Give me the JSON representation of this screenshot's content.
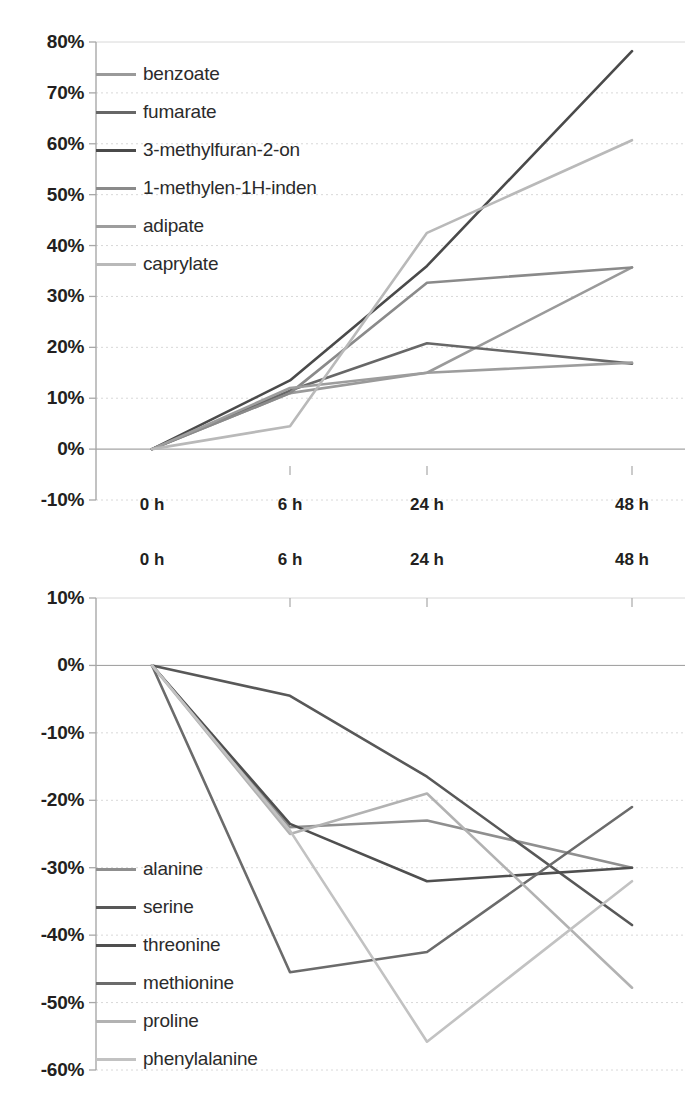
{
  "chart_data": [
    {
      "type": "line",
      "id": "aroma-compounds-increase",
      "title": "",
      "xlabel": "",
      "ylabel": "",
      "x": [
        "0 h",
        "6 h",
        "24 h",
        "48 h"
      ],
      "categories": [
        "0 h",
        "6 h",
        "24 h",
        "48 h"
      ],
      "ylim": [
        -10,
        80
      ],
      "yticks": [
        "80%",
        "70%",
        "60%",
        "50%",
        "40%",
        "30%",
        "20%",
        "10%",
        "0%",
        "-10%"
      ],
      "ytick_values": [
        80,
        70,
        60,
        50,
        40,
        30,
        20,
        10,
        0,
        -10
      ],
      "grid": true,
      "legend_position": "upper-left-inside",
      "series": [
        {
          "name": "benzoate",
          "values": [
            0,
            11.0,
            15.0,
            35.7
          ],
          "color": "#9a9a9a"
        },
        {
          "name": "fumarate",
          "values": [
            0,
            11.5,
            20.8,
            16.8
          ],
          "color": "#676767"
        },
        {
          "name": "3-methylfuran-2-on",
          "values": [
            0,
            13.5,
            36.0,
            78.2
          ],
          "color": "#4a4a4a"
        },
        {
          "name": "1-methylen-1H-inden",
          "values": [
            0,
            11.0,
            32.7,
            35.7
          ],
          "color": "#8a8a8a"
        },
        {
          "name": "adipate",
          "values": [
            0,
            12.0,
            15.0,
            17.0
          ],
          "color": "#9d9d9d"
        },
        {
          "name": "caprylate",
          "values": [
            0,
            4.5,
            42.5,
            60.7
          ],
          "color": "#b9b9b9"
        }
      ]
    },
    {
      "type": "line",
      "id": "amino-acids-decrease",
      "title": "",
      "xlabel": "",
      "ylabel": "",
      "x": [
        "0 h",
        "6 h",
        "24 h",
        "48 h"
      ],
      "categories": [
        "0 h",
        "6 h",
        "24 h",
        "48 h"
      ],
      "ylim": [
        -60,
        10
      ],
      "yticks": [
        "10%",
        "0%",
        "-10%",
        "-20%",
        "-30%",
        "-40%",
        "-50%",
        "-60%"
      ],
      "ytick_values": [
        10,
        0,
        -10,
        -20,
        -30,
        -40,
        -50,
        -60
      ],
      "grid": true,
      "legend_position": "lower-left-inside",
      "series": [
        {
          "name": "alanine",
          "values": [
            0,
            -24.0,
            -23.0,
            -30.0
          ],
          "color": "#8f8f8f"
        },
        {
          "name": "serine",
          "values": [
            0,
            -4.5,
            -16.5,
            -38.5
          ],
          "color": "#585858"
        },
        {
          "name": "threonine",
          "values": [
            0,
            -23.5,
            -32.0,
            -30.0
          ],
          "color": "#4f4f4f"
        },
        {
          "name": "methionine",
          "values": [
            0,
            -45.5,
            -42.5,
            -21.0
          ],
          "color": "#6b6b6b"
        },
        {
          "name": "proline",
          "values": [
            0,
            -25.0,
            -19.0,
            -47.8
          ],
          "color": "#b2b2b2"
        },
        {
          "name": "phenylalanine",
          "values": [
            0,
            -24.5,
            -55.8,
            -32.0
          ],
          "color": "#c2c2c2"
        }
      ]
    }
  ],
  "top_chart": {
    "yticks": [
      "80%",
      "70%",
      "60%",
      "50%",
      "40%",
      "30%",
      "20%",
      "10%",
      "0%",
      "-10%"
    ],
    "xticks": [
      "0 h",
      "6 h",
      "24 h",
      "48 h"
    ],
    "legend": [
      {
        "label": "benzoate"
      },
      {
        "label": "fumarate"
      },
      {
        "label": "3-methylfuran-2-on"
      },
      {
        "label": "1-methylen-1H-inden"
      },
      {
        "label": "adipate"
      },
      {
        "label": "caprylate"
      }
    ]
  },
  "bottom_chart": {
    "yticks": [
      "10%",
      "0%",
      "-10%",
      "-20%",
      "-30%",
      "-40%",
      "-50%",
      "-60%"
    ],
    "xticks_top": [
      "0 h",
      "6 h",
      "24 h",
      "48 h"
    ],
    "legend": [
      {
        "label": "alanine"
      },
      {
        "label": "serine"
      },
      {
        "label": "threonine"
      },
      {
        "label": "methionine"
      },
      {
        "label": "proline"
      },
      {
        "label": "phenylalanine"
      }
    ]
  },
  "colors": {
    "axis": "#a8a8a8",
    "grid": "#d8d8d8",
    "text": "#231f20"
  }
}
